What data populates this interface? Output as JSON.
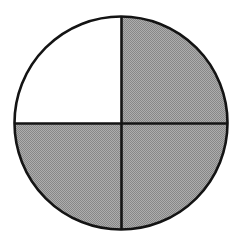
{
  "figure": {
    "title": "Shaded circle fraction diagram",
    "kind": "fraction-circle",
    "canvas": {
      "width": 240,
      "height": 245,
      "background_color": "#ffffff"
    },
    "circle": {
      "center_x": 121,
      "center_y": 123,
      "radius": 106.5,
      "outline_color": "#141414",
      "outline_width": 2.6,
      "fill_color": "#ffffff"
    },
    "dividers": [
      {
        "name": "vertical-divider",
        "orientation": "vertical",
        "position": 121.5,
        "color": "#141414",
        "width": 2.6
      },
      {
        "name": "horizontal-divider",
        "orientation": "horizontal",
        "position": 123.5,
        "color": "#141414",
        "width": 2.6
      }
    ],
    "shading": {
      "fill_color": "#9a9a9a",
      "dither_light": "#adadad",
      "dither_dark": "#878787",
      "pattern": "checkerboard-dither",
      "pattern_size": 2
    },
    "quadrants": [
      {
        "name": "upper-left",
        "label": "Upper left quadrant",
        "shaded": false,
        "start_angle": 180,
        "end_angle": 270
      },
      {
        "name": "upper-right",
        "label": "Upper right quadrant",
        "shaded": true,
        "start_angle": 270,
        "end_angle": 360
      },
      {
        "name": "lower-right",
        "label": "Lower right quadrant",
        "shaded": true,
        "start_angle": 0,
        "end_angle": 90
      },
      {
        "name": "lower-left",
        "label": "Lower left quadrant",
        "shaded": true,
        "start_angle": 90,
        "end_angle": 180
      }
    ],
    "totals": {
      "total_parts": 4,
      "shaded_parts": 3,
      "unshaded_parts": 1,
      "fraction_shaded": "3/4"
    }
  },
  "chart_data": {
    "type": "pie",
    "title": "Shaded circle fraction diagram",
    "categories": [
      "Upper left",
      "Upper right",
      "Lower right",
      "Lower left"
    ],
    "values": [
      25,
      25,
      25,
      25
    ],
    "labels": [
      "unshaded",
      "shaded",
      "shaded",
      "shaded"
    ],
    "colors": [
      "#ffffff",
      "#9a9a9a",
      "#9a9a9a",
      "#9a9a9a"
    ],
    "fraction_shaded": "3/4",
    "xlabel": "",
    "ylabel": "",
    "legend": false,
    "grid": false
  }
}
